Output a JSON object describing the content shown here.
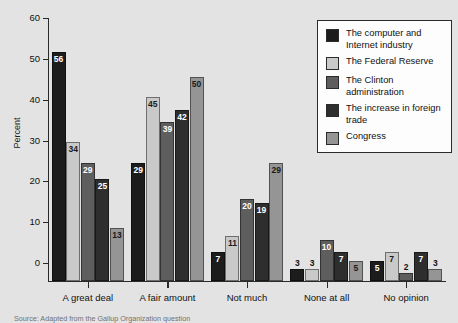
{
  "chart_data": {
    "type": "bar",
    "title": "",
    "xlabel": "",
    "ylabel": "Percent",
    "ylim": [
      0,
      60
    ],
    "yticks": [
      0,
      10,
      20,
      30,
      40,
      50,
      60
    ],
    "grid": false,
    "legend_position": "top-right",
    "categories": [
      "A great deal",
      "A fair amount",
      "Not much",
      "None at all",
      "No opinion"
    ],
    "series": [
      {
        "name": "The computer and Internet industry",
        "color": "#1c1c1c",
        "values": [
          56,
          29,
          7,
          3,
          5
        ]
      },
      {
        "name": "The Federal Reserve",
        "color": "#c9c9c9",
        "values": [
          34,
          45,
          11,
          3,
          7
        ]
      },
      {
        "name": "The Clinton administration",
        "color": "#5e5e5e",
        "values": [
          29,
          39,
          20,
          10,
          2
        ]
      },
      {
        "name": "The increase in foreign trade",
        "color": "#2e2e2e",
        "values": [
          25,
          42,
          19,
          7,
          7
        ]
      },
      {
        "name": "Congress",
        "color": "#959595",
        "values": [
          13,
          50,
          29,
          5,
          3
        ]
      }
    ]
  },
  "legend": {
    "items": [
      {
        "label": "The computer and Internet industry",
        "swatch": "#1c1c1c"
      },
      {
        "label": "The Federal Reserve",
        "swatch": "#c9c9c9"
      },
      {
        "label": "The Clinton administration",
        "swatch": "#5e5e5e"
      },
      {
        "label": "The increase in foreign trade",
        "swatch": "#2e2e2e"
      },
      {
        "label": "Congress",
        "swatch": "#959595"
      }
    ]
  },
  "source": {
    "text": "Source: Adapted from the Gallup Organization question"
  }
}
